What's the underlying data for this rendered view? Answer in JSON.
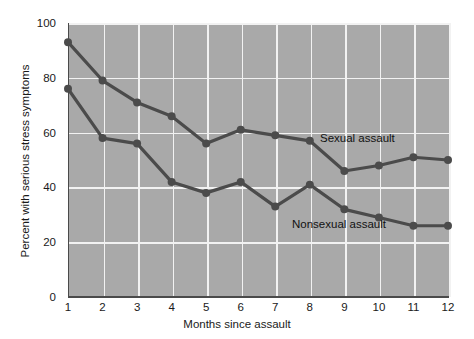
{
  "chart_data": {
    "type": "line",
    "title": "",
    "xlabel": "Months since assault",
    "ylabel": "Percent with serious stress symptoms",
    "x": [
      1,
      2,
      3,
      4,
      5,
      6,
      7,
      8,
      9,
      10,
      11,
      12
    ],
    "xtick_labels": [
      "1",
      "2",
      "3",
      "4",
      "5",
      "6",
      "7",
      "8",
      "9",
      "10",
      "11",
      "12"
    ],
    "ytick_labels": [
      "0",
      "20",
      "40",
      "60",
      "80",
      "100"
    ],
    "yticks": [
      0,
      20,
      40,
      60,
      80,
      100
    ],
    "xlim": [
      1,
      12
    ],
    "ylim": [
      0,
      100
    ],
    "grid": "both-white-on-gray",
    "legend_position": "inline-annotations",
    "series": [
      {
        "name": "Sexual assault",
        "values": [
          93,
          79,
          71,
          66,
          56,
          61,
          59,
          57,
          46,
          48,
          51,
          50
        ]
      },
      {
        "name": "Nonsexual assault",
        "values": [
          76,
          58,
          56,
          42,
          38,
          42,
          33,
          41,
          32,
          29,
          26,
          26
        ]
      }
    ],
    "annotations": [
      {
        "text": "Sexual assault",
        "series": "Sexual assault"
      },
      {
        "text": "Nonsexual assault",
        "series": "Nonsexual assault"
      }
    ],
    "colors": {
      "plot_background": "#a9a9a9",
      "gridline": "#f2f2f2",
      "series_line": "#4b4b4b",
      "axis": "#4a4a4a",
      "text": "#1a1a1a",
      "figure_background": "#ffffff"
    }
  }
}
